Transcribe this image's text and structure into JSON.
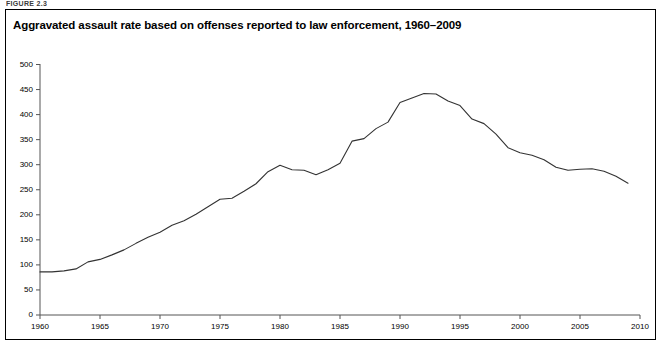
{
  "figure": {
    "label": "FIGURE 2.3",
    "title": "Aggravated assault rate based on offenses reported to law enforcement, 1960–2009"
  },
  "chart_data": {
    "type": "line",
    "title": "Aggravated assault rate based on offenses reported to law enforcement, 1960–2009",
    "xlabel": "",
    "ylabel": "",
    "xlim": [
      1960,
      2010
    ],
    "ylim": [
      0,
      500
    ],
    "grid": false,
    "legend": null,
    "line_color": "#333333",
    "xticks": [
      1960,
      1965,
      1970,
      1975,
      1980,
      1985,
      1990,
      1995,
      2000,
      2005,
      2010
    ],
    "yticks": [
      0,
      50,
      100,
      150,
      200,
      250,
      300,
      350,
      400,
      450,
      500
    ],
    "xtick_labels": [
      "1960",
      "1965",
      "1970",
      "1975",
      "1980",
      "1985",
      "1990",
      "1995",
      "2000",
      "2005",
      "2010"
    ],
    "ytick_labels": [
      "0",
      "50",
      "100",
      "150",
      "200",
      "250",
      "300",
      "350",
      "400",
      "450",
      "500"
    ],
    "x": [
      1960,
      1961,
      1962,
      1963,
      1964,
      1965,
      1966,
      1967,
      1968,
      1969,
      1970,
      1971,
      1972,
      1973,
      1974,
      1975,
      1976,
      1977,
      1978,
      1979,
      1980,
      1981,
      1982,
      1983,
      1984,
      1985,
      1986,
      1987,
      1988,
      1989,
      1990,
      1991,
      1992,
      1993,
      1994,
      1995,
      1996,
      1997,
      1998,
      1999,
      2000,
      2001,
      2002,
      2003,
      2004,
      2005,
      2006,
      2007,
      2008,
      2009
    ],
    "values": [
      86,
      86,
      88,
      92,
      106,
      111,
      120,
      130,
      143,
      155,
      165,
      179,
      188,
      201,
      216,
      231,
      233,
      247,
      262,
      286,
      299,
      290,
      289,
      280,
      290,
      303,
      347,
      352,
      372,
      385,
      424,
      433,
      442,
      441,
      427,
      418,
      391,
      382,
      361,
      334,
      324,
      319,
      310,
      295,
      289,
      291,
      292,
      287,
      277,
      263
    ]
  }
}
